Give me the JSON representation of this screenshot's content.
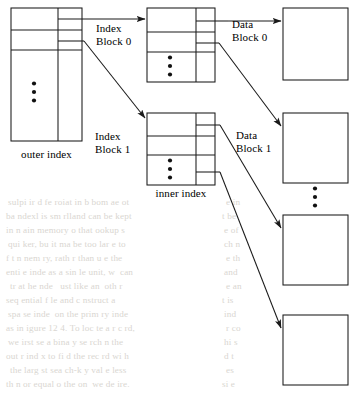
{
  "diagram": {
    "stroke_color": "#1a1a1a",
    "background_color": "#ffffff",
    "bleed_text_color": "#d9d6d1",
    "labels": {
      "outer_index": "outer index",
      "inner_index": "inner index",
      "index_block_0_line1": "Index",
      "index_block_0_line2": "Block 0",
      "index_block_1_line1": "Index",
      "index_block_1_line2": "Block 1",
      "data_block_0_line1": "Data",
      "data_block_0_line2": "Block 0",
      "data_block_1_line1": "Data",
      "data_block_1_line2": "Block 1"
    },
    "vertical_ellipsis_glyph": "•",
    "outer_index": {
      "name": "outer index",
      "x": 11,
      "y": 8,
      "width": 71,
      "height": 133,
      "divider_x": 58,
      "row_lines_y": [
        30,
        50
      ],
      "ellipsis_x": 34,
      "ellipsis_y": 92
    },
    "inner_index_blocks": [
      {
        "name": "Index Block 0",
        "x": 147,
        "y": 8,
        "width": 68,
        "height": 74,
        "divider_x": 196,
        "row_lines_y": [
          32,
          52
        ],
        "ellipsis_x": 170,
        "ellipsis_y": 66
      },
      {
        "name": "Index Block 1",
        "x": 147,
        "y": 113,
        "width": 68,
        "height": 72,
        "divider_x": 196,
        "row_lines_y": [
          136,
          155
        ],
        "ellipsis_x": 170,
        "ellipsis_y": 169
      }
    ],
    "data_blocks": [
      {
        "name": "Data Block 0",
        "labeled": true,
        "x": 283,
        "y": 8,
        "width": 65,
        "height": 72
      },
      {
        "name": "Data Block 1",
        "labeled": true,
        "x": 283,
        "y": 113,
        "width": 65,
        "height": 70
      },
      {
        "name": "Data Block 2",
        "labeled": false,
        "x": 283,
        "y": 215,
        "width": 65,
        "height": 70
      },
      {
        "name": "Data Block 3",
        "labeled": false,
        "x": 283,
        "y": 315,
        "width": 65,
        "height": 70
      }
    ],
    "data_block_ellipsis": {
      "x": 315,
      "y": 197
    },
    "pointers": [
      {
        "from": "outer-index-row-0",
        "to": "index-block-0",
        "style": "straight-arrow"
      },
      {
        "from": "outer-index-row-1",
        "to": "index-block-1",
        "style": "diagonal-arrow"
      },
      {
        "from": "index-block-0-row-0",
        "to": "data-block-0",
        "style": "straight-arrow"
      },
      {
        "from": "index-block-0-row-1",
        "to": "data-block-1",
        "style": "diagonal-arrow"
      },
      {
        "from": "index-block-1-row-0",
        "to": "data-block-2",
        "style": "diagonal-arrow"
      },
      {
        "from": "index-block-1-row-2",
        "to": "data-block-3",
        "style": "diagonal-arrow"
      }
    ]
  },
  "page_bleed": {
    "description": "faint show-through of text printed on the reverse side of the page",
    "lines": [
      {
        "x": 8,
        "y": 196,
        "text": "sulpi ir d fe roiat in b bom ae ot"
      },
      {
        "x": 6,
        "y": 210,
        "text": "ba ndexl is sm rlland can be kept"
      },
      {
        "x": 6,
        "y": 224,
        "text": "in n ain memory o that ookup s"
      },
      {
        "x": 8,
        "y": 238,
        "text": "qui ker, bu it ma be too lar e to"
      },
      {
        "x": 6,
        "y": 252,
        "text": "f t n nem ry, rath r than u e the"
      },
      {
        "x": 6,
        "y": 266,
        "text": "enti e inde as a sin le unit, w  can"
      },
      {
        "x": 10,
        "y": 280,
        "text": "tr at he nde   ust like an  oth r"
      },
      {
        "x": 6,
        "y": 294,
        "text": "seq ential f le and c nstruct a"
      },
      {
        "x": 8,
        "y": 308,
        "text": "spa se inde  on the prim ry inde"
      },
      {
        "x": 6,
        "y": 322,
        "text": "as in igure 12 4. To loc te a r c rd,"
      },
      {
        "x": 8,
        "y": 336,
        "text": "we irst se a bina y se rch n the"
      },
      {
        "x": 6,
        "y": 350,
        "text": "out r ind x to fi d the rec rd wi h"
      },
      {
        "x": 10,
        "y": 364,
        "text": "the larg st sea ch-k y val e less"
      },
      {
        "x": 6,
        "y": 378,
        "text": "th n or equal o the on  we de ire."
      }
    ],
    "right_lines": [
      {
        "x": 226,
        "y": 196,
        "text": "e in"
      },
      {
        "x": 222,
        "y": 210,
        "text": "t be"
      },
      {
        "x": 224,
        "y": 224,
        "text": "e of"
      },
      {
        "x": 224,
        "y": 238,
        "text": "ch n"
      },
      {
        "x": 226,
        "y": 252,
        "text": "e th"
      },
      {
        "x": 224,
        "y": 266,
        "text": "and"
      },
      {
        "x": 226,
        "y": 280,
        "text": "e an"
      },
      {
        "x": 222,
        "y": 294,
        "text": "t is"
      },
      {
        "x": 224,
        "y": 308,
        "text": "ind"
      },
      {
        "x": 226,
        "y": 322,
        "text": "r co"
      },
      {
        "x": 224,
        "y": 336,
        "text": "hi s"
      },
      {
        "x": 224,
        "y": 350,
        "text": "d t"
      },
      {
        "x": 226,
        "y": 364,
        "text": "es"
      },
      {
        "x": 222,
        "y": 378,
        "text": "si e"
      }
    ]
  }
}
